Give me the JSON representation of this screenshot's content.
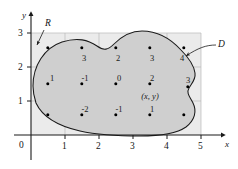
{
  "figure": {
    "kind": "double-integral-riemann-sum-diagram",
    "background_color": "#ffffff",
    "rect_fill": "#ebebeb",
    "region_fill": "#cfcfcf",
    "curve_color": "#1a1a1a",
    "axis_color": "#1a1a1a",
    "grid_color": "#b8b8b8",
    "point_color": "#000000"
  },
  "axes": {
    "x_label": "x",
    "y_label": "y",
    "origin_label": "0",
    "x_ticks": [
      "1",
      "2",
      "3",
      "4",
      "5"
    ],
    "x_tick_values": [
      1,
      2,
      3,
      4,
      5
    ],
    "y_ticks": [
      "1",
      "2",
      "3"
    ],
    "y_tick_values": [
      1,
      2,
      3
    ],
    "x_range": [
      0,
      5.6
    ],
    "y_range": [
      0,
      3.35
    ],
    "grid": true
  },
  "annotations": [
    {
      "name": "rectangle-label",
      "text": "R",
      "x": 0.56,
      "y": 3.16,
      "leader_to": [
        0.42,
        2.78
      ]
    },
    {
      "name": "region-label",
      "text": "D",
      "x": 5.28,
      "y": 2.66,
      "leader_to": [
        4.66,
        2.4
      ]
    },
    {
      "name": "sample-point-label",
      "text": "(x, y)",
      "x": 3.5,
      "y": 1.24
    }
  ],
  "sample_points": [
    {
      "x": 0.5,
      "y": 2.55,
      "value": null,
      "inside": false
    },
    {
      "x": 1.5,
      "y": 2.55,
      "value": "3",
      "inside": true
    },
    {
      "x": 2.5,
      "y": 2.55,
      "value": "2",
      "inside": true
    },
    {
      "x": 3.5,
      "y": 2.55,
      "value": "3",
      "inside": true
    },
    {
      "x": 4.5,
      "y": 2.55,
      "value": "4",
      "inside": true
    },
    {
      "x": 0.5,
      "y": 1.5,
      "value": "1",
      "inside": true
    },
    {
      "x": 1.5,
      "y": 1.5,
      "value": "-1",
      "inside": true
    },
    {
      "x": 2.5,
      "y": 1.5,
      "value": "0",
      "inside": true
    },
    {
      "x": 3.5,
      "y": 1.5,
      "value": "2",
      "inside": true
    },
    {
      "x": 4.62,
      "y": 1.42,
      "value": "3",
      "inside": true
    },
    {
      "x": 0.5,
      "y": 0.58,
      "value": null,
      "inside": false
    },
    {
      "x": 1.5,
      "y": 0.58,
      "value": "-2",
      "inside": true
    },
    {
      "x": 2.5,
      "y": 0.58,
      "value": "-1",
      "inside": true
    },
    {
      "x": 3.5,
      "y": 0.58,
      "value": "1",
      "inside": true
    },
    {
      "x": 4.5,
      "y": 0.58,
      "value": null,
      "inside": false
    }
  ],
  "region_boundary_note": "Closed smooth curve D enclosing the labeled sample points inside rectangle R = [0,5] x [0,3]."
}
